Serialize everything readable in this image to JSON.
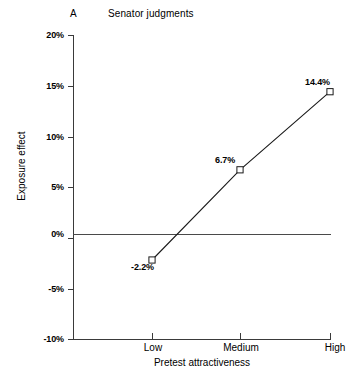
{
  "chart_data": {
    "type": "line",
    "title": "Senator judgments",
    "panel_label": "A",
    "xlabel": "Pretest attractiveness",
    "ylabel": "Exposure effect",
    "categories": [
      "Low",
      "Medium",
      "High"
    ],
    "values": [
      -2.2,
      6.7,
      14.4
    ],
    "point_labels": [
      "-2.2%",
      "6.7%",
      "14.4%"
    ],
    "ylim": [
      -10,
      20
    ],
    "yticks": [
      20,
      15,
      10,
      5,
      0,
      -5,
      -10
    ],
    "ytick_labels": [
      "20%",
      "15%",
      "10%",
      "5%",
      "0%",
      "-5%",
      "-10%"
    ],
    "grid": false,
    "legend": "none",
    "marker": "open-square",
    "zero_reference_line": true,
    "series": [
      {
        "name": "Exposure effect",
        "values": [
          -2.2,
          6.7,
          14.4
        ]
      }
    ],
    "colors": {
      "line": "#1a1a1a",
      "marker_fill": "#ffffff",
      "marker_stroke": "#1a1a1a",
      "axis": "#3a3a3a",
      "text": "#000000",
      "background": "#ffffff"
    }
  }
}
